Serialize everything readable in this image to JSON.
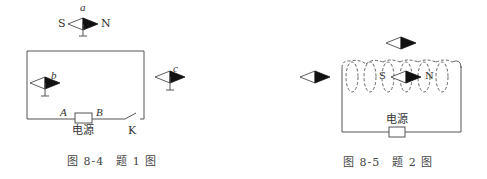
{
  "figure1": {
    "caption": "图 8-4　题 1 图",
    "compass_a": {
      "label": "a",
      "south": "S",
      "north": "N"
    },
    "compass_b": {
      "label": "b"
    },
    "compass_c": {
      "label": "c"
    },
    "terminal_a": "A",
    "terminal_b": "B",
    "power_label": "电源",
    "switch_label": "K"
  },
  "figure2": {
    "caption": "图 8-5　题 2 图",
    "inner_south": "S",
    "inner_north": "N",
    "power_label": "电源"
  },
  "colors": {
    "line": "#555555",
    "needle_fill": "#111111"
  }
}
